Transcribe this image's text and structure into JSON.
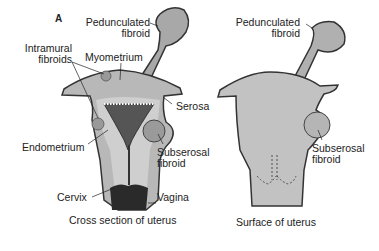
{
  "panel_label": "A",
  "left": {
    "caption": "Cross section of uterus",
    "labels": {
      "pedunculated": [
        "Pedunculated",
        "fibroid"
      ],
      "intramural": [
        "Intramural",
        "fibroids"
      ],
      "myometrium": "Myometrium",
      "serosa": "Serosa",
      "endometrium": "Endometrium",
      "subserosal": [
        "Subserosal",
        "fibroid"
      ],
      "cervix": "Cervix",
      "vagina": "Vagina"
    }
  },
  "right": {
    "caption": "Surface of uterus",
    "labels": {
      "pedunculated": [
        "Pedunculated",
        "fibroid"
      ],
      "subserosal": [
        "Subserosal",
        "fibroid"
      ]
    }
  }
}
